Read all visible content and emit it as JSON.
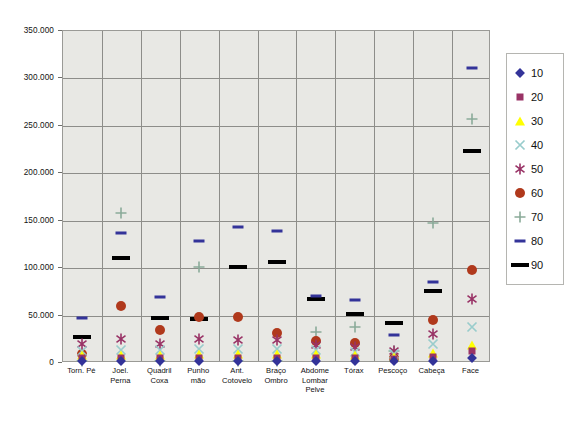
{
  "chart_data": {
    "type": "scatter",
    "title": "",
    "xlabel": "",
    "ylabel": "",
    "ylim": [
      0,
      350000
    ],
    "yticks": [
      0,
      50000,
      100000,
      150000,
      200000,
      250000,
      300000,
      350000
    ],
    "ytick_labels": [
      "0",
      "50.000",
      "100.000",
      "150.000",
      "200.000",
      "250.000",
      "300.000",
      "350.000"
    ],
    "grid": true,
    "legend_position": "right",
    "categories": [
      "Torn. Pé",
      "Joel.\nPerna",
      "Quadril\nCoxa",
      "Punho\nmão",
      "Ant.\nCotovelo",
      "Braço\nOmbro",
      "Abdome\nLombar\nPelve",
      "Tórax",
      "Pescoço",
      "Cabeça",
      "Face"
    ],
    "series": [
      {
        "name": "10",
        "marker": "diamond",
        "color": "#333399",
        "values": [
          2500,
          2500,
          2200,
          2300,
          2300,
          2300,
          2200,
          2000,
          1800,
          2500,
          5000
        ]
      },
      {
        "name": "20",
        "marker": "square",
        "color": "#993366",
        "values": [
          5500,
          5000,
          5000,
          5500,
          5500,
          5500,
          5500,
          5000,
          4500,
          6500,
          13000
        ]
      },
      {
        "name": "30",
        "marker": "triangle",
        "color": "#ffff00",
        "values": [
          8500,
          8500,
          8500,
          9000,
          9500,
          9500,
          9000,
          8000,
          6500,
          11000,
          19000
        ]
      },
      {
        "name": "40",
        "marker": "cross-x",
        "color": "#99cccc",
        "values": [
          13000,
          13500,
          13500,
          14500,
          14500,
          14500,
          13500,
          12000,
          9500,
          20000,
          38000
        ]
      },
      {
        "name": "50",
        "marker": "asterisk",
        "color": "#993366",
        "values": [
          20000,
          25000,
          20000,
          25000,
          24500,
          24000,
          19500,
          17000,
          12500,
          31000,
          67500
        ]
      },
      {
        "name": "60",
        "marker": "circle",
        "color": "#b0391c",
        "values": [
          10000,
          60000,
          35000,
          48500,
          48000,
          32000,
          23000,
          21000,
          5000,
          45000,
          98500
        ]
      },
      {
        "name": "70",
        "marker": "plus",
        "color": "#8aab99",
        "values": [
          2000,
          158000,
          2000,
          101000,
          2000,
          2000,
          33000,
          38000,
          13000,
          148000,
          257000
        ]
      },
      {
        "name": "80",
        "marker": "dash-thin",
        "color": "#333399",
        "values": [
          47500,
          137500,
          70000,
          129000,
          143500,
          139000,
          70500,
          66500,
          30000,
          85000,
          310500
        ]
      },
      {
        "name": "90",
        "marker": "dash-thick",
        "color": "#000000",
        "values": [
          27000,
          110500,
          47500,
          46500,
          101000,
          107000,
          67500,
          51500,
          42000,
          76000,
          223000
        ]
      }
    ]
  },
  "legend": {
    "items": [
      {
        "label": "10",
        "marker": "diamond",
        "color": "#333399"
      },
      {
        "label": "20",
        "marker": "square",
        "color": "#993366"
      },
      {
        "label": "30",
        "marker": "triangle",
        "color": "#ffff00"
      },
      {
        "label": "40",
        "marker": "cross-x",
        "color": "#99cccc"
      },
      {
        "label": "50",
        "marker": "asterisk",
        "color": "#993366"
      },
      {
        "label": "60",
        "marker": "circle",
        "color": "#b0391c"
      },
      {
        "label": "70",
        "marker": "plus",
        "color": "#8aab99"
      },
      {
        "label": "80",
        "marker": "dash-thin",
        "color": "#333399"
      },
      {
        "label": "90",
        "marker": "dash-thick",
        "color": "#000000"
      }
    ]
  },
  "caption": "",
  "colors": {
    "plot_background": "#e8e8e4",
    "gridline": "#8d8d89",
    "page_background": "#ffffff"
  }
}
